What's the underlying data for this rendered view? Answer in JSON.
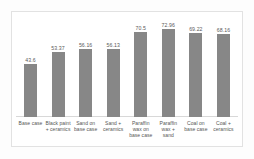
{
  "chart_data": {
    "type": "bar",
    "title": "",
    "subtitle": "",
    "xlabel": "",
    "ylabel": "",
    "grid": false,
    "legend": false,
    "ylim": [
      0,
      80
    ],
    "categories": [
      "Base case",
      "Black paint + ceramics",
      "Sand on base case",
      "Sand + ceramics",
      "Paraffin wax on base case",
      "Paraffin wax + sand",
      "Coal on base case",
      "Coal + ceramics"
    ],
    "values": [
      43.6,
      53.37,
      56.16,
      56.13,
      70.5,
      72.96,
      69.22,
      68.16
    ],
    "value_labels": [
      "43.6",
      "53.37",
      "56.16",
      "56.13",
      "70.5",
      "72.96",
      "69.22",
      "68.16"
    ],
    "bar_color": "#878787",
    "frame_color": "#e2e2e2",
    "background_color": "#ffffff"
  }
}
